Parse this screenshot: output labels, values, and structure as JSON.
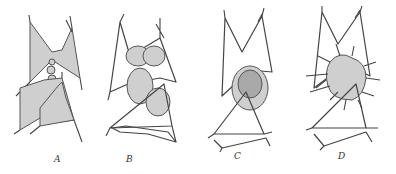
{
  "figure": {
    "type": "scientific-illustration",
    "panels": [
      {
        "id": "A",
        "label": "A",
        "x": 57
      },
      {
        "id": "B",
        "label": "B",
        "x": 130
      },
      {
        "id": "C",
        "label": "C",
        "x": 237
      },
      {
        "id": "D",
        "label": "D",
        "x": 341
      }
    ],
    "colors": {
      "ink": "#444444",
      "stipple": "#c8c8c8",
      "dense_stipple": "#a8a8a8",
      "background": "#ffffff"
    }
  }
}
